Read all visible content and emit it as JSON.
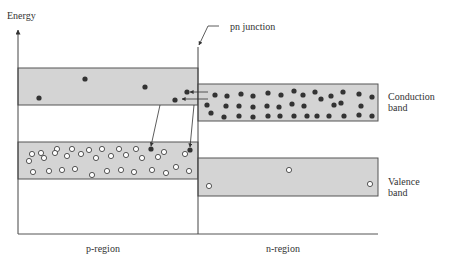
{
  "labels": {
    "y_axis": "Energy",
    "junction": "pn junction",
    "conduction_band_line1": "Conduction",
    "conduction_band_line2": "band",
    "valence_band_line1": "Valence",
    "valence_band_line2": "band",
    "p_region": "p-region",
    "n_region": "n-region"
  },
  "colors": {
    "band_fill": "#d4d4d4",
    "band_stroke": "#555555",
    "line": "#444444",
    "electron": "#333333",
    "hole_fill": "#ffffff"
  },
  "bands": {
    "p_conduction": {
      "x": 18,
      "y": 68,
      "w": 180,
      "h": 37
    },
    "n_conduction": {
      "x": 198,
      "y": 84,
      "w": 180,
      "h": 37
    },
    "p_valence": {
      "x": 18,
      "y": 142,
      "w": 180,
      "h": 37
    },
    "n_valence": {
      "x": 198,
      "y": 158,
      "w": 180,
      "h": 38
    }
  },
  "particles": {
    "p_conduction_electrons": [
      [
        39,
        98
      ],
      [
        85,
        79
      ],
      [
        145,
        87
      ],
      [
        187,
        92
      ],
      [
        175,
        100
      ]
    ],
    "n_conduction_electrons": [
      [
        215,
        95
      ],
      [
        227,
        96
      ],
      [
        241,
        94
      ],
      [
        253,
        96
      ],
      [
        268,
        93
      ],
      [
        281,
        95
      ],
      [
        294,
        91
      ],
      [
        303,
        95
      ],
      [
        315,
        92
      ],
      [
        321,
        99
      ],
      [
        331,
        96
      ],
      [
        343,
        92
      ],
      [
        359,
        94
      ],
      [
        372,
        97
      ],
      [
        207,
        105
      ],
      [
        226,
        106
      ],
      [
        239,
        106
      ],
      [
        253,
        107
      ],
      [
        267,
        106
      ],
      [
        279,
        107
      ],
      [
        292,
        104
      ],
      [
        304,
        106
      ],
      [
        334,
        105
      ],
      [
        341,
        103
      ],
      [
        361,
        106
      ],
      [
        211,
        113
      ],
      [
        224,
        117
      ],
      [
        239,
        116
      ],
      [
        253,
        117
      ],
      [
        268,
        116
      ],
      [
        280,
        116
      ],
      [
        294,
        116
      ],
      [
        307,
        116
      ],
      [
        317,
        116
      ],
      [
        329,
        116
      ],
      [
        344,
        116
      ],
      [
        359,
        115
      ],
      [
        372,
        116
      ]
    ],
    "p_valence_electrons": [
      [
        151,
        149
      ],
      [
        190,
        150
      ]
    ],
    "p_valence_holes": [
      [
        32,
        154
      ],
      [
        41,
        153
      ],
      [
        57,
        149
      ],
      [
        72,
        149
      ],
      [
        89,
        150
      ],
      [
        102,
        149
      ],
      [
        119,
        149
      ],
      [
        136,
        149
      ],
      [
        164,
        152
      ],
      [
        29,
        161
      ],
      [
        44,
        158
      ],
      [
        55,
        153
      ],
      [
        67,
        156
      ],
      [
        81,
        154
      ],
      [
        96,
        158
      ],
      [
        111,
        156
      ],
      [
        126,
        155
      ],
      [
        142,
        158
      ],
      [
        158,
        157
      ],
      [
        185,
        154
      ],
      [
        33,
        172
      ],
      [
        49,
        171
      ],
      [
        62,
        170
      ],
      [
        75,
        169
      ],
      [
        92,
        175
      ],
      [
        107,
        171
      ],
      [
        121,
        170
      ],
      [
        134,
        172
      ],
      [
        152,
        170
      ],
      [
        166,
        173
      ],
      [
        176,
        167
      ],
      [
        189,
        171
      ]
    ],
    "n_valence_holes": [
      [
        209,
        186
      ],
      [
        289,
        170
      ],
      [
        370,
        184
      ]
    ]
  },
  "arrows": {
    "horizontal": [
      [
        208,
        92,
        190,
        92
      ],
      [
        208,
        99,
        182,
        99
      ]
    ],
    "diagonal": [
      [
        160,
        105,
        151,
        146
      ],
      [
        194,
        105,
        190,
        147
      ]
    ]
  }
}
